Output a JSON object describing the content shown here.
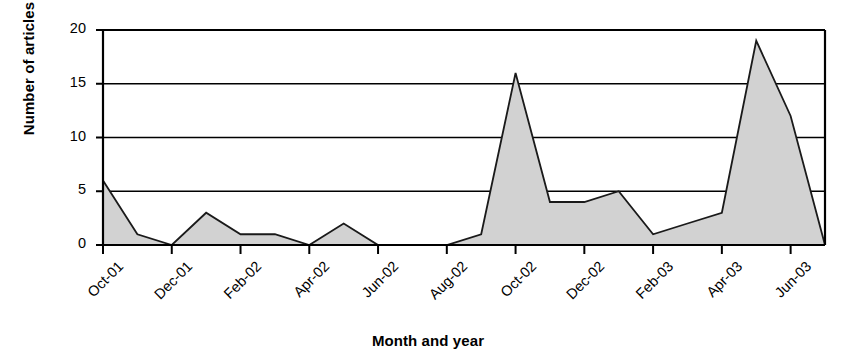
{
  "chart_data": {
    "type": "area",
    "title": "",
    "xlabel": "Month and year",
    "ylabel": "Number of articles",
    "ylim": [
      0,
      20
    ],
    "yticks": [
      0,
      5,
      10,
      15,
      20
    ],
    "grid": true,
    "legend": false,
    "x_tick_labels": [
      "Oct-01",
      "Dec-01",
      "Feb-02",
      "Apr-02",
      "Jun-02",
      "Aug-02",
      "Oct-02",
      "Dec-02",
      "Feb-03",
      "Apr-03",
      "Jun-03"
    ],
    "x_tick_step_months": 2,
    "categories": [
      "Oct-01",
      "Nov-01",
      "Dec-01",
      "Jan-02",
      "Feb-02",
      "Mar-02",
      "Apr-02",
      "May-02",
      "Jun-02",
      "Jul-02",
      "Aug-02",
      "Sep-02",
      "Oct-02",
      "Nov-02",
      "Dec-02",
      "Jan-03",
      "Feb-03",
      "Mar-03",
      "Apr-03",
      "May-03",
      "Jun-03",
      "Jul-03"
    ],
    "values": [
      6,
      1,
      0,
      3,
      1,
      1,
      0,
      2,
      0,
      0,
      0,
      1,
      16,
      4,
      4,
      5,
      1,
      2,
      3,
      19,
      12,
      0
    ],
    "series": [
      {
        "name": "Number of articles",
        "values": [
          6,
          1,
          0,
          3,
          1,
          1,
          0,
          2,
          0,
          0,
          0,
          1,
          16,
          4,
          4,
          5,
          1,
          2,
          3,
          19,
          12,
          0
        ]
      }
    ],
    "fill_color": "#d2d2d2",
    "line_color": "#1a1a1a",
    "axis_color": "#000000",
    "background_color": "#ffffff"
  }
}
